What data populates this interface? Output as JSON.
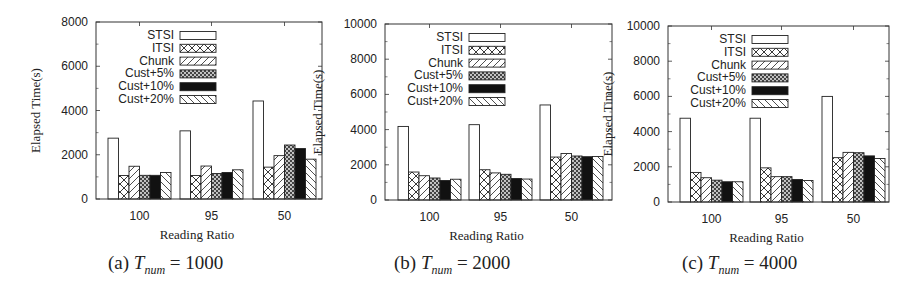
{
  "figure": {
    "panels": [
      {
        "label": "(a)",
        "var": "T",
        "sub": "num",
        "eq": "= 1000"
      },
      {
        "label": "(b)",
        "var": "T",
        "sub": "num",
        "eq": "= 2000"
      },
      {
        "label": "(c)",
        "var": "T",
        "sub": "num",
        "eq": "= 4000"
      }
    ]
  },
  "chart_data": [
    {
      "type": "bar",
      "title": "(a) T_num = 1000",
      "xlabel": "Reading Ratio",
      "ylabel": "Elapsed Time(s)",
      "categories": [
        "100",
        "95",
        "50"
      ],
      "ylim": [
        0,
        8000
      ],
      "yticks": [
        0,
        2000,
        4000,
        6000,
        8000
      ],
      "legend_position": "top-left inside",
      "grid": false,
      "series": [
        {
          "name": "STSI",
          "pattern": "empty",
          "values": [
            2750,
            3080,
            4430
          ]
        },
        {
          "name": "ITSI",
          "pattern": "crosshatch",
          "values": [
            1060,
            1060,
            1440
          ]
        },
        {
          "name": "Chunk",
          "pattern": "diag-forward",
          "values": [
            1480,
            1490,
            1960
          ]
        },
        {
          "name": "Cust+5%",
          "pattern": "dots",
          "values": [
            1070,
            1150,
            2440
          ]
        },
        {
          "name": "Cust+10%",
          "pattern": "solid-black",
          "values": [
            1070,
            1200,
            2280
          ]
        },
        {
          "name": "Cust+20%",
          "pattern": "diag-back",
          "values": [
            1200,
            1320,
            1800
          ]
        }
      ]
    },
    {
      "type": "bar",
      "title": "(b) T_num = 2000",
      "xlabel": "Reading Ratio",
      "ylabel": "Elapsed Time(s)",
      "categories": [
        "100",
        "95",
        "50"
      ],
      "ylim": [
        0,
        10000
      ],
      "yticks": [
        0,
        2000,
        4000,
        6000,
        8000,
        10000
      ],
      "legend_position": "top-left inside",
      "grid": false,
      "series": [
        {
          "name": "STSI",
          "pattern": "empty",
          "values": [
            4180,
            4280,
            5400
          ]
        },
        {
          "name": "ITSI",
          "pattern": "crosshatch",
          "values": [
            1590,
            1720,
            2440
          ]
        },
        {
          "name": "Chunk",
          "pattern": "diag-forward",
          "values": [
            1380,
            1540,
            2640
          ]
        },
        {
          "name": "Cust+5%",
          "pattern": "dots",
          "values": [
            1250,
            1460,
            2500
          ]
        },
        {
          "name": "Cust+10%",
          "pattern": "solid-black",
          "values": [
            1110,
            1220,
            2460
          ]
        },
        {
          "name": "Cust+20%",
          "pattern": "diag-back",
          "values": [
            1180,
            1190,
            2470
          ]
        }
      ]
    },
    {
      "type": "bar",
      "title": "(c) T_num = 4000",
      "xlabel": "Reading Ratio",
      "ylabel": "Elapsed Time(s)",
      "categories": [
        "100",
        "95",
        "50"
      ],
      "ylim": [
        0,
        10000
      ],
      "yticks": [
        0,
        2000,
        4000,
        6000,
        8000,
        10000
      ],
      "legend_position": "top-left inside",
      "grid": false,
      "series": [
        {
          "name": "STSI",
          "pattern": "empty",
          "values": [
            4760,
            4760,
            6000
          ]
        },
        {
          "name": "ITSI",
          "pattern": "crosshatch",
          "values": [
            1680,
            1940,
            2520
          ]
        },
        {
          "name": "Chunk",
          "pattern": "diag-forward",
          "values": [
            1380,
            1440,
            2820
          ]
        },
        {
          "name": "Cust+5%",
          "pattern": "dots",
          "values": [
            1240,
            1440,
            2800
          ]
        },
        {
          "name": "Cust+10%",
          "pattern": "solid-black",
          "values": [
            1150,
            1280,
            2620
          ]
        },
        {
          "name": "Cust+20%",
          "pattern": "diag-back",
          "values": [
            1150,
            1220,
            2470
          ]
        }
      ]
    }
  ]
}
